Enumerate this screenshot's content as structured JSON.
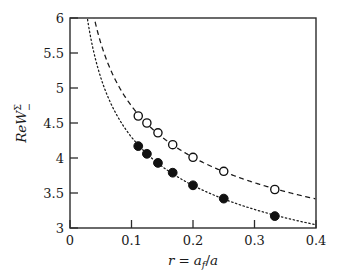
{
  "chart_data": {
    "type": "scatter",
    "title": "",
    "xlabel": "r = a_f/a",
    "ylabel": "ReW^Sigma_-",
    "xlim": [
      0,
      0.4
    ],
    "ylim": [
      3,
      6
    ],
    "xticks": [
      "0",
      "0.1",
      "0.2",
      "0.3",
      "0.4"
    ],
    "xtick_values": [
      0,
      0.1,
      0.2,
      0.3,
      0.4
    ],
    "yticks": [
      "3",
      "3.5",
      "4",
      "4.5",
      "5",
      "5.5",
      "6"
    ],
    "ytick_values": [
      3,
      3.5,
      4,
      4.5,
      5,
      5.5,
      6
    ],
    "grid": false,
    "legend": "none",
    "series": [
      {
        "name": "open-circles",
        "marker": "open-circle",
        "line": "dashed",
        "x": [
          0.111,
          0.125,
          0.143,
          0.167,
          0.2,
          0.25,
          0.333
        ],
        "values": [
          4.6,
          4.5,
          4.36,
          4.19,
          4.01,
          3.81,
          3.55
        ]
      },
      {
        "name": "filled-circles",
        "marker": "filled-circle",
        "line": "dotted",
        "x": [
          0.111,
          0.125,
          0.143,
          0.167,
          0.2,
          0.25,
          0.333
        ],
        "values": [
          4.17,
          4.06,
          3.93,
          3.79,
          3.61,
          3.42,
          3.17
        ]
      }
    ],
    "curves": [
      {
        "name": "dashed-curve",
        "style": "dashed",
        "x_start": 0.0325,
        "x_end": 0.4,
        "y_at_start": 6.0,
        "y_at_end": 3.38
      },
      {
        "name": "dotted-curve",
        "style": "dotted",
        "x_start": 0.0225,
        "x_end": 0.4,
        "y_at_start": 6.0,
        "y_at_end": 3.0
      }
    ]
  },
  "axis": {
    "x_label_parts": {
      "r": "r",
      "equals": "=",
      "a": "a",
      "f": "f",
      "slash": "/",
      "a2": "a"
    },
    "y_label_parts": {
      "re": "Re",
      "w": "W",
      "sigma": "Σ",
      "minus": "−"
    }
  },
  "colors": {
    "axis": "#2b2b2b",
    "marker": "#111111",
    "background": "#ffffff"
  }
}
